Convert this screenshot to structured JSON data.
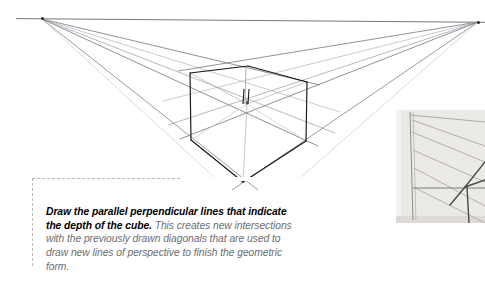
{
  "page": {
    "background_color": "#ffffff",
    "width": 485,
    "height": 286
  },
  "caption": {
    "lead": "Draw the parallel perpendicular lines that indicate the depth of the cube.",
    "body": " This creates new intersections with the previously drawn diagonals that are used to draw new lines of perspective to finish the geometric form.",
    "lead_color": "#000000",
    "body_color": "#6d6d6d",
    "border_color": "#b9b9b9",
    "border_style": "dashed"
  },
  "diagram": {
    "name": "two-point-perspective-cube",
    "line_color_dark": "#1a1a1a",
    "line_color_light": "#9a9aa2",
    "line_color_faint": "#c8c8d0",
    "horizon_color": "#555555",
    "vanishing_point_left": {
      "x": 42,
      "y": 19,
      "label": "left-vanishing-point"
    },
    "vanishing_point_right": {
      "x": 478,
      "y": 22,
      "label": "right-vanishing-point"
    },
    "cube": {
      "top_back": {
        "x": 248,
        "y": 66
      },
      "top_left": {
        "x": 190,
        "y": 73
      },
      "top_right": {
        "x": 307,
        "y": 82
      },
      "front_top": {
        "x": 247,
        "y": 104
      },
      "bottom_left": {
        "x": 191,
        "y": 140
      },
      "bottom_right": {
        "x": 306,
        "y": 141
      },
      "front_bottom": {
        "x": 243,
        "y": 182
      }
    }
  },
  "photo_inset": {
    "name": "reference-photograph",
    "background_color": "#f2f1ef",
    "paper_tint": "#ebe9e6",
    "pencil_color": "#8d8b8a",
    "pencil_dark": "#5d5c5c"
  }
}
